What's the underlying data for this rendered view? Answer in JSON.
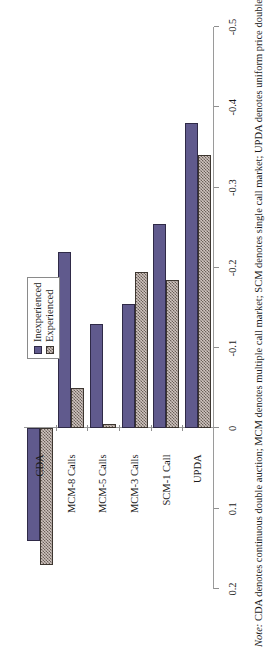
{
  "chart_data": {
    "type": "bar",
    "orientation": "vertical",
    "title": "",
    "xlabel": "",
    "ylabel": "Actual Volume-CE Volume",
    "categories": [
      "CDA",
      "MCM-8 Calls",
      "MCM-5 Calls",
      "MCM-3 Calls",
      "SCM-1 Call",
      "UPDA"
    ],
    "series": [
      {
        "name": "Inexperienced",
        "color": "#605a8d",
        "values": [
          0.14,
          -0.22,
          -0.13,
          -0.155,
          -0.255,
          -0.38
        ]
      },
      {
        "name": "Experienced",
        "color": "#cfc4bf",
        "pattern": "checkerboard",
        "values": [
          0.17,
          -0.05,
          -0.005,
          -0.195,
          -0.185,
          -0.34
        ]
      }
    ],
    "ylim": [
      -0.5,
      0.2
    ],
    "y_ticks": [
      0.2,
      0.1,
      0,
      -0.1,
      -0.2,
      -0.3,
      -0.4,
      -0.5
    ],
    "y_tick_labels": [
      "0.2",
      "0.1",
      "0",
      "-0.1",
      "-0.2",
      "-0.3",
      "-0.4",
      "-0.5"
    ],
    "grid": false,
    "legend_position": "upper-right"
  },
  "axis": {
    "value_axis_title": "Actual Volume-CE Volume"
  },
  "legend": {
    "items": [
      {
        "label": "Inexperienced"
      },
      {
        "label": "Experienced"
      }
    ]
  },
  "note": {
    "lead": "Note:",
    "text": " CDA denotes continuous double auction; MCM denotes multiple call market; SCM denotes single call market; UPDA denotes uniform price double"
  },
  "colors": {
    "inexperienced": "#605a8d",
    "experienced_ground": "#cfc4bf",
    "experienced_hatch": "#6b6059",
    "axis": "#9a9a9a",
    "background": "#ffffff"
  }
}
